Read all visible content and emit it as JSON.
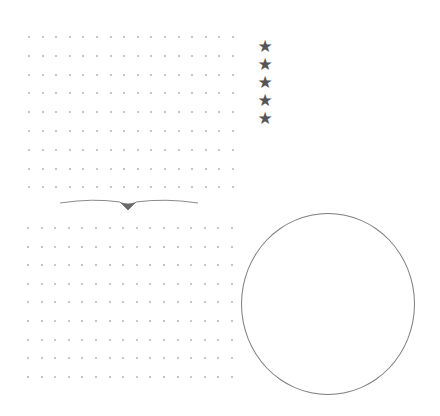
{
  "upper_grid": {
    "left": 28,
    "top": 36,
    "cols": 16,
    "rows": 9,
    "dx": 13.6,
    "dy": 18.8,
    "color": "#b4b4b4"
  },
  "lower_grid": {
    "left": 27,
    "top": 227,
    "cols": 16,
    "rows": 9,
    "dx": 13.6,
    "dy": 18.6,
    "color": "#b4b4b4"
  },
  "rating": {
    "stars": [
      "★",
      "★",
      "★",
      "★",
      "★"
    ],
    "color": "#555555"
  },
  "divider": {
    "color": "#8a8a8a"
  },
  "circle": {
    "border_color": "#7d7d7d",
    "faint_lines": [
      "",
      ""
    ]
  }
}
